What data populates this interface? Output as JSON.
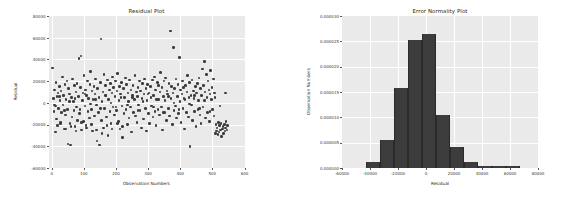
{
  "figure": {
    "background_color": "#ffffff",
    "axes_background_color": "#eaeaea",
    "grid_color": "#ffffff",
    "marker_color": "#3c3c3c",
    "bar_color": "#3c3c3c"
  },
  "chart_data": [
    {
      "type": "scatter",
      "title": "Residual Plot",
      "xlabel": "Observation Numbers",
      "ylabel": "Residual",
      "xlim": [
        -10,
        600
      ],
      "ylim": [
        -60000,
        80000
      ],
      "xticks": [
        0,
        100,
        200,
        300,
        400,
        500,
        600
      ],
      "xtick_labels": [
        "0",
        "100",
        "200",
        "300",
        "400",
        "500",
        "600"
      ],
      "yticks": [
        -60000,
        -40000,
        -20000,
        0,
        20000,
        40000,
        60000,
        80000
      ],
      "ytick_labels": [
        "-60000",
        "-40000",
        "-20000",
        "0",
        "20000",
        "40000",
        "60000",
        "80000"
      ],
      "grid": true,
      "legend": "none",
      "marker_size": 2.6,
      "x": [
        3,
        5,
        7,
        9,
        11,
        13,
        15,
        16,
        18,
        20,
        22,
        24,
        26,
        27,
        29,
        31,
        33,
        35,
        37,
        39,
        41,
        43,
        45,
        47,
        49,
        51,
        53,
        55,
        57,
        59,
        61,
        63,
        65,
        67,
        69,
        71,
        73,
        75,
        77,
        79,
        81,
        83,
        85,
        87,
        89,
        91,
        93,
        95,
        97,
        99,
        101,
        103,
        105,
        107,
        109,
        111,
        113,
        115,
        117,
        119,
        121,
        123,
        125,
        127,
        129,
        131,
        133,
        135,
        137,
        139,
        141,
        143,
        145,
        147,
        149,
        151,
        153,
        155,
        157,
        159,
        161,
        163,
        165,
        167,
        169,
        171,
        173,
        175,
        177,
        179,
        181,
        183,
        185,
        187,
        189,
        191,
        193,
        195,
        197,
        199,
        201,
        203,
        205,
        207,
        209,
        211,
        213,
        215,
        217,
        219,
        221,
        223,
        225,
        227,
        229,
        231,
        233,
        235,
        237,
        239,
        241,
        243,
        245,
        247,
        249,
        251,
        253,
        255,
        257,
        259,
        261,
        263,
        265,
        267,
        269,
        271,
        273,
        275,
        277,
        279,
        281,
        283,
        285,
        287,
        289,
        291,
        293,
        295,
        297,
        299,
        301,
        303,
        305,
        307,
        309,
        311,
        313,
        315,
        317,
        319,
        321,
        323,
        325,
        327,
        329,
        331,
        333,
        335,
        337,
        339,
        341,
        343,
        345,
        347,
        349,
        351,
        353,
        355,
        357,
        359,
        361,
        363,
        365,
        367,
        369,
        371,
        373,
        375,
        377,
        379,
        381,
        383,
        385,
        387,
        389,
        391,
        393,
        395,
        397,
        399,
        401,
        403,
        405,
        407,
        409,
        411,
        413,
        415,
        417,
        419,
        421,
        423,
        425,
        427,
        429,
        431,
        433,
        435,
        437,
        439,
        441,
        443,
        445,
        447,
        449,
        451,
        453,
        455,
        457,
        459,
        461,
        463,
        465,
        467,
        469,
        471,
        473,
        475,
        477,
        479,
        481,
        483,
        485,
        487,
        489,
        491,
        493,
        495,
        497,
        499,
        501,
        503,
        505,
        507,
        509,
        511,
        513,
        515,
        517,
        519,
        521,
        523,
        525,
        527,
        529,
        531,
        533,
        535,
        537,
        539,
        541,
        543,
        545,
        547,
        12,
        28,
        44,
        60,
        76,
        92,
        108,
        124,
        140,
        156,
        172,
        188,
        204,
        220,
        236,
        252,
        268,
        284,
        300,
        316,
        332,
        348,
        364,
        380,
        396,
        412,
        428,
        444,
        460,
        476,
        492,
        508,
        524,
        540,
        8,
        24,
        40,
        56,
        72,
        88,
        104,
        120,
        136,
        152,
        168,
        184,
        200,
        216,
        232,
        248,
        264,
        280,
        296,
        312,
        328,
        344,
        360,
        376,
        392,
        408,
        424,
        440,
        456,
        472,
        488,
        504,
        520,
        536
      ],
      "y": [
        32000,
        4000,
        -8000,
        12000,
        -3000,
        19000,
        -15000,
        6000,
        -21000,
        9000,
        -5000,
        15000,
        2000,
        -18000,
        11000,
        -9000,
        24000,
        -2000,
        7000,
        -24000,
        17000,
        -11000,
        3000,
        20000,
        -6000,
        -38000,
        13000,
        8000,
        -19000,
        -39000,
        5000,
        -13000,
        22000,
        1000,
        -7000,
        16000,
        -22000,
        10000,
        -4000,
        18000,
        -16000,
        6000,
        41000,
        -10000,
        14000,
        43000,
        -25000,
        2000,
        9000,
        -17000,
        25000,
        -3000,
        12000,
        -21000,
        7000,
        20000,
        -8000,
        4000,
        -14000,
        17000,
        29000,
        -6000,
        11000,
        -26000,
        3000,
        15000,
        -12000,
        8000,
        22000,
        -2000,
        -35000,
        13000,
        -9000,
        5000,
        -39000,
        19000,
        59000,
        -16000,
        1000,
        10000,
        -23000,
        26000,
        -5000,
        16000,
        7000,
        -13000,
        21000,
        -30000,
        3000,
        12000,
        -8000,
        18000,
        -19000,
        9000,
        24000,
        -4000,
        14000,
        -11000,
        6000,
        20000,
        -7000,
        11000,
        27000,
        -17000,
        2000,
        15000,
        -24000,
        8000,
        19000,
        -3000,
        -32000,
        13000,
        -10000,
        5000,
        23000,
        -6000,
        17000,
        -20000,
        9000,
        1000,
        -14000,
        21000,
        -4000,
        12000,
        -27000,
        7000,
        16000,
        -9000,
        3000,
        25000,
        -12000,
        10000,
        -18000,
        6000,
        14000,
        -2000,
        20000,
        -7000,
        11000,
        -23000,
        4000,
        18000,
        -15000,
        8000,
        22000,
        -5000,
        13000,
        -26000,
        2000,
        17000,
        -10000,
        9000,
        -19000,
        15000,
        5000,
        -3000,
        21000,
        -13000,
        7000,
        24000,
        -8000,
        12000,
        -21000,
        3000,
        19000,
        -6000,
        16000,
        -11000,
        10000,
        28000,
        -4000,
        14000,
        -25000,
        6000,
        20000,
        -9000,
        2000,
        23000,
        -16000,
        11000,
        8000,
        -5000,
        18000,
        -12000,
        66000,
        4000,
        15000,
        -20000,
        9000,
        51000,
        -7000,
        13000,
        -3000,
        22000,
        -14000,
        6000,
        17000,
        -10000,
        42000,
        1000,
        12000,
        -18000,
        8000,
        20000,
        -5000,
        14000,
        -24000,
        3000,
        16000,
        -9000,
        10000,
        25000,
        -13000,
        5000,
        19000,
        -40000,
        7000,
        -2000,
        21000,
        -16000,
        11000,
        4000,
        -8000,
        15000,
        -22000,
        9000,
        18000,
        -6000,
        2000,
        23000,
        -11000,
        13000,
        -19000,
        7000,
        31000,
        -4000,
        16000,
        38000,
        10000,
        -14000,
        26000,
        5000,
        -9000,
        20000,
        12000,
        -17000,
        8000,
        30000,
        3000,
        14000,
        -6000,
        22000,
        -12000,
        9000,
        -28000,
        -20000,
        -26000,
        -23000,
        -29000,
        -18000,
        -27000,
        -21000,
        -25000,
        -19000,
        -31000,
        -24000,
        -22000,
        -28000,
        -20000,
        -26000,
        -23000,
        -17000,
        -25000,
        -21000,
        -27000,
        -19000,
        -24000,
        -22000,
        -26000,
        -18000,
        -23000,
        -20000,
        -25000,
        -28000,
        -21000,
        -24000,
        -19000,
        -22000,
        -2000,
        5000,
        -7000,
        1000,
        8000,
        -4000,
        3000,
        -9000,
        6000,
        0,
        -6000,
        4000,
        -1000,
        7000,
        -5000,
        2000,
        -8000,
        5000,
        -3000,
        9000,
        -2000,
        6000,
        -7000,
        1000,
        4000,
        -6000,
        8000,
        -1000,
        3000,
        -5000,
        7000,
        0,
        -4000,
        5000
      ]
    },
    {
      "type": "bar",
      "subtype": "histogram",
      "title": "Error Normality Plot",
      "xlabel": "Residual",
      "ylabel": "Observation Numbers",
      "xlim": [
        -60000,
        80000
      ],
      "ylim": [
        0,
        3e-05
      ],
      "xticks": [
        -60000,
        -40000,
        -20000,
        0,
        20000,
        40000,
        60000,
        80000
      ],
      "xtick_labels": [
        "-60000",
        "-40000",
        "-20000",
        "0",
        "20000",
        "40000",
        "60000",
        "80000"
      ],
      "yticks": [
        0,
        5e-06,
        1e-05,
        1.5e-05,
        2e-05,
        2.5e-05,
        3e-05
      ],
      "ytick_labels": [
        "0.000000",
        "0.000005",
        "0.000010",
        "0.000015",
        "0.000020",
        "0.000025",
        "0.000030"
      ],
      "grid": true,
      "legend": "none",
      "bin_edges": [
        -43000,
        -33000,
        -23000,
        -13000,
        -3000,
        7000,
        17000,
        27000,
        37000,
        47000,
        57000,
        67000
      ],
      "values": [
        1.2e-06,
        5.5e-06,
        1.57e-05,
        2.52e-05,
        2.65e-05,
        1.04e-05,
        4.2e-06,
        1.2e-06,
        3e-07,
        3e-07,
        3e-07
      ]
    }
  ]
}
